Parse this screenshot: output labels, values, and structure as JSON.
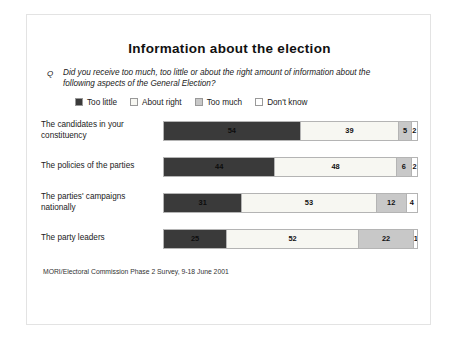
{
  "slide": {
    "title": "Information about the election",
    "question_marker": "Q",
    "question": "Did you receive too much, too little or about the right amount of information about the following aspects of the General Election?",
    "source": "MORI/Electoral Commission Phase 2 Survey, 9-18 June 2001"
  },
  "chart_data": {
    "type": "bar",
    "orientation": "horizontal",
    "stacked": true,
    "title": "Information about the election",
    "xlabel": "",
    "ylabel": "",
    "xlim": [
      0,
      100
    ],
    "grid": false,
    "legend_position": "top",
    "categories": [
      "The candidates in your constituency",
      "The policies of the parties",
      "The parties' campaigns nationally",
      "The party leaders"
    ],
    "series": [
      {
        "name": "Too little",
        "color": "#3a3a3a",
        "values": [
          54,
          44,
          31,
          25
        ]
      },
      {
        "name": "About right",
        "color": "#f7f7f2",
        "values": [
          39,
          48,
          53,
          52
        ]
      },
      {
        "name": "Too much",
        "color": "#c8c8c8",
        "values": [
          5,
          6,
          12,
          22
        ]
      },
      {
        "name": "Don't know",
        "color": "#ffffff",
        "values": [
          2,
          2,
          4,
          1
        ]
      }
    ]
  }
}
